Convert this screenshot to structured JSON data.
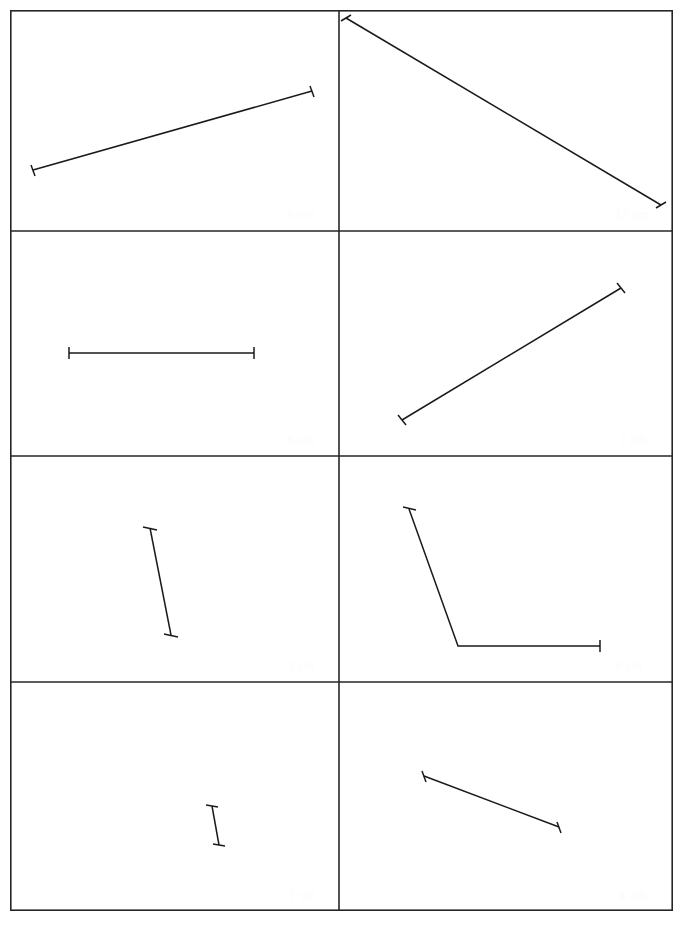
{
  "worksheet": {
    "title": "Measuring line segments worksheet",
    "grid": {
      "columns": 2,
      "rows": 4,
      "border_color": "#262626",
      "line_color": "#1a1a1a",
      "label_color": "#fcfcfc",
      "background_color": "#ffffff"
    },
    "cells": [
      {
        "id": "cell-1",
        "position": "row1-col1",
        "label": "8 cm",
        "shape": "line-segment",
        "orientation": "diagonal-up-right",
        "points": "33,160 312,81",
        "end_ticks": 2
      },
      {
        "id": "cell-2",
        "position": "row1-col2",
        "label": "12 cm",
        "shape": "line-segment",
        "orientation": "diagonal-down-right",
        "points": "346,18 661,205",
        "end_ticks": 2
      },
      {
        "id": "cell-3",
        "position": "row2-col1",
        "label": "5 cm",
        "shape": "line-segment",
        "orientation": "horizontal",
        "points": "69,353 254,353",
        "end_ticks": 2
      },
      {
        "id": "cell-4",
        "position": "row2-col2",
        "label": "7 cm",
        "shape": "line-segment",
        "orientation": "diagonal-up-right",
        "points": "402,420 621,288",
        "end_ticks": 2
      },
      {
        "id": "cell-5",
        "position": "row3-col1",
        "label": "3 cm",
        "shape": "line-segment",
        "orientation": "near-vertical",
        "points": "150,528 171,635",
        "end_ticks": 2
      },
      {
        "id": "cell-6",
        "position": "row3-col2",
        "label": "8 cm",
        "shape": "bent-polyline",
        "orientation": "bent-down-right",
        "points": "409,509 458,646 600,646",
        "end_ticks": 2
      },
      {
        "id": "cell-7",
        "position": "row4-col1",
        "label": "1 cm",
        "shape": "line-segment",
        "orientation": "near-vertical",
        "points": "212,806 219,845",
        "end_ticks": 2
      },
      {
        "id": "cell-8",
        "position": "row4-col2",
        "label": "4 cm",
        "shape": "line-segment",
        "orientation": "diagonal-down-right",
        "points": "424,776 559,827",
        "end_ticks": 2
      }
    ]
  }
}
